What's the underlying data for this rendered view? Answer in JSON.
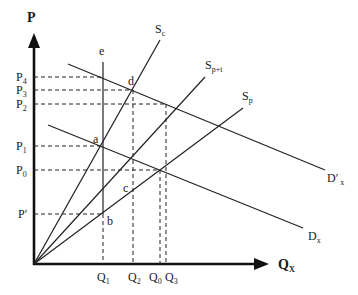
{
  "axes": {
    "y_label": "P",
    "x_label_main": "Q",
    "x_label_sub": "X",
    "origin": [
      34,
      264
    ]
  },
  "price_labels": [
    {
      "main": "P",
      "sub": "4",
      "y": 77
    },
    {
      "main": "P",
      "sub": "3",
      "y": 90
    },
    {
      "main": "P",
      "sub": "2",
      "y": 104
    },
    {
      "main": "P",
      "sub": "1",
      "y": 146
    },
    {
      "main": "P",
      "sub": "0",
      "y": 170
    },
    {
      "main": "P′",
      "sub": "",
      "y": 214
    }
  ],
  "quantity_labels": [
    {
      "main": "Q",
      "sub": "1",
      "x": 103
    },
    {
      "main": "Q",
      "sub": "2",
      "x": 133
    },
    {
      "main": "Q",
      "sub": "0",
      "x": 160
    },
    {
      "main": "Q",
      "sub": "3",
      "x": 166
    }
  ],
  "curves": {
    "sc": {
      "main": "S",
      "sub": "c"
    },
    "spt": {
      "main": "S",
      "sub": "p+t"
    },
    "sp": {
      "main": "S",
      "sub": "p"
    },
    "dx_prime": {
      "main": "D′",
      "sub": "x"
    },
    "dx": {
      "main": "D",
      "sub": "x"
    },
    "e": "e"
  },
  "points": {
    "a": "a",
    "b": "b",
    "c": "c",
    "d": "d"
  }
}
